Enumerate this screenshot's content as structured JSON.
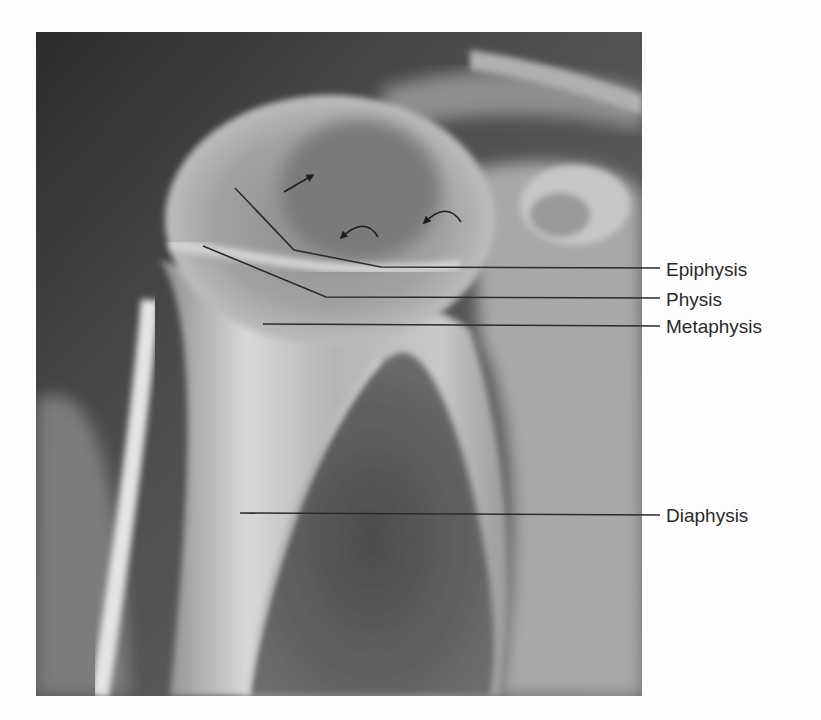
{
  "figure": {
    "type": "radiograph",
    "background_color": "#fdfdfd",
    "image_bounds": {
      "x": 36,
      "y": 32,
      "width": 606,
      "height": 664
    }
  },
  "annotations": {
    "line_color": "#2b2b2b",
    "labels": [
      {
        "text": "Epiphysis",
        "x": 666,
        "y": 260,
        "leader": [
          [
            235,
            188
          ],
          [
            294,
            250
          ],
          [
            381,
            267
          ],
          [
            660,
            268
          ]
        ]
      },
      {
        "text": "Physis",
        "x": 666,
        "y": 290,
        "leader": [
          [
            203,
            246
          ],
          [
            326,
            297
          ],
          [
            660,
            298
          ]
        ]
      },
      {
        "text": "Metaphysis",
        "x": 666,
        "y": 317,
        "leader": [
          [
            263,
            324
          ],
          [
            660,
            326
          ]
        ]
      },
      {
        "text": "Diaphysis",
        "x": 666,
        "y": 510,
        "leader": [
          [
            240,
            513
          ],
          [
            660,
            515
          ]
        ]
      }
    ],
    "arrows": [
      {
        "kind": "straight",
        "from": [
          284,
          192
        ],
        "to": [
          313,
          175
        ]
      },
      {
        "kind": "curved",
        "from": [
          378,
          237
        ],
        "ctrl": [
          365,
          215
        ],
        "to": [
          341,
          238
        ]
      },
      {
        "kind": "curved",
        "from": [
          461,
          222
        ],
        "ctrl": [
          447,
          200
        ],
        "to": [
          424,
          223
        ]
      }
    ]
  }
}
